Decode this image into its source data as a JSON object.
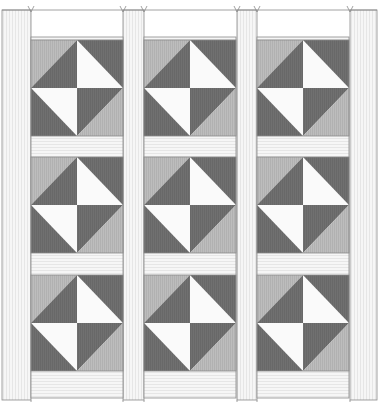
{
  "diagram": {
    "type": "quilt-layout",
    "title": "",
    "grid": {
      "rows": 3,
      "cols": 3
    },
    "block_name": "hourglass-variation",
    "colors": {
      "background": "#ffffff",
      "sashing": "#f6f6f6",
      "sashing_stripe": "#dcdcdc",
      "outline": "#8a8a8a",
      "light": "#bdbdbd",
      "light_stripe": "#a9a9a9",
      "dark": "#707070",
      "dark_stripe": "#636363",
      "white": "#fafafa"
    },
    "columns_x": [
      31,
      144,
      257
    ],
    "rows_y": [
      40,
      157,
      275
    ],
    "block_size": {
      "w": 92,
      "h": 96
    },
    "sashing": {
      "vertical_x": [
        [
          2,
          31
        ],
        [
          123,
          144
        ],
        [
          237,
          257
        ],
        [
          350,
          377
        ]
      ],
      "outer_top": 10,
      "outer_bottom": 400,
      "inner_top": 37
    },
    "marks_top_x": [
      31,
      123,
      144,
      237,
      257,
      350
    ],
    "marks_bottom_x": [
      31,
      123,
      144,
      237,
      257,
      350
    ]
  }
}
